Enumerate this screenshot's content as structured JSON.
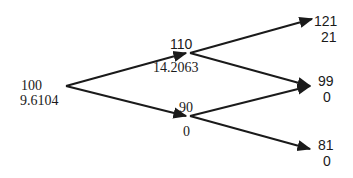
{
  "diagram": {
    "type": "binomial-tree",
    "nodes": {
      "root": {
        "price": "100",
        "value": "9.6104"
      },
      "up": {
        "price": "110",
        "value": "14.2063"
      },
      "down": {
        "price": "90",
        "value": "0"
      },
      "up_up": {
        "price": "121",
        "value": "21"
      },
      "up_down": {
        "price": "99",
        "value": "0"
      },
      "down_down": {
        "price": "81",
        "value": "0"
      }
    },
    "edges": [
      {
        "from": "root",
        "to": "up"
      },
      {
        "from": "root",
        "to": "down"
      },
      {
        "from": "up",
        "to": "up_up"
      },
      {
        "from": "up",
        "to": "up_down"
      },
      {
        "from": "down",
        "to": "up_down"
      },
      {
        "from": "down",
        "to": "down_down"
      }
    ],
    "line_color": "#1a1a1a"
  }
}
